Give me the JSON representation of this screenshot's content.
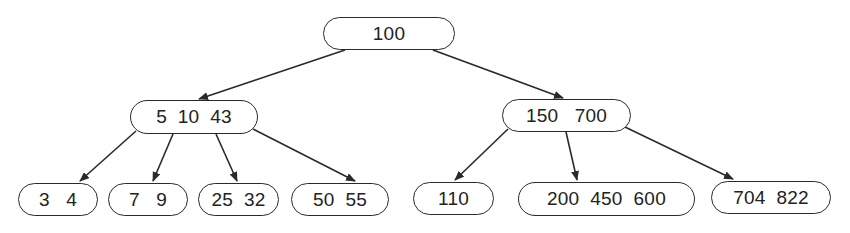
{
  "diagram": {
    "type": "b-tree",
    "colors": {
      "stroke": "#2a2a2a",
      "text": "#222222",
      "background": "#ffffff"
    },
    "nodes": {
      "root": {
        "label": "100",
        "keys": [
          100
        ],
        "x": 323,
        "y": 17,
        "w": 132,
        "h": 33
      },
      "internal_left": {
        "label": "5  10  43",
        "keys": [
          5,
          10,
          43
        ],
        "x": 130,
        "y": 100,
        "w": 128,
        "h": 34
      },
      "internal_right": {
        "label": "150   700",
        "keys": [
          150,
          700
        ],
        "x": 502,
        "y": 99,
        "w": 129,
        "h": 33
      },
      "leaf_1": {
        "label": "3   4",
        "keys": [
          3,
          4
        ],
        "x": 18,
        "y": 183,
        "w": 80,
        "h": 33
      },
      "leaf_2": {
        "label": "7   9",
        "keys": [
          7,
          9
        ],
        "x": 108,
        "y": 183,
        "w": 80,
        "h": 33
      },
      "leaf_3": {
        "label": "25  32",
        "keys": [
          25,
          32
        ],
        "x": 198,
        "y": 183,
        "w": 81,
        "h": 33
      },
      "leaf_4": {
        "label": "50  55",
        "keys": [
          50,
          55
        ],
        "x": 291,
        "y": 183,
        "w": 98,
        "h": 33
      },
      "leaf_5": {
        "label": "110",
        "keys": [
          110
        ],
        "x": 413,
        "y": 182,
        "w": 81,
        "h": 33
      },
      "leaf_6": {
        "label": "200  450  600",
        "keys": [
          200,
          450,
          600
        ],
        "x": 518,
        "y": 182,
        "w": 177,
        "h": 34
      },
      "leaf_7": {
        "label": "704  822",
        "keys": [
          704,
          822
        ],
        "x": 711,
        "y": 181,
        "w": 120,
        "h": 33
      }
    },
    "edges": [
      {
        "from": "root",
        "to": "internal_left",
        "x1": 345,
        "y1": 50,
        "x2": 199,
        "y2": 99
      },
      {
        "from": "root",
        "to": "internal_right",
        "x1": 433,
        "y1": 50,
        "x2": 563,
        "y2": 98
      },
      {
        "from": "internal_left",
        "to": "leaf_1",
        "x1": 136,
        "y1": 131,
        "x2": 80,
        "y2": 181
      },
      {
        "from": "internal_left",
        "to": "leaf_2",
        "x1": 173,
        "y1": 134,
        "x2": 153,
        "y2": 181
      },
      {
        "from": "internal_left",
        "to": "leaf_3",
        "x1": 216,
        "y1": 134,
        "x2": 237,
        "y2": 181
      },
      {
        "from": "internal_left",
        "to": "leaf_4",
        "x1": 253,
        "y1": 129,
        "x2": 355,
        "y2": 181
      },
      {
        "from": "internal_right",
        "to": "leaf_5",
        "x1": 508,
        "y1": 129,
        "x2": 455,
        "y2": 180
      },
      {
        "from": "internal_right",
        "to": "leaf_6",
        "x1": 566,
        "y1": 132,
        "x2": 577,
        "y2": 180
      },
      {
        "from": "internal_right",
        "to": "leaf_7",
        "x1": 625,
        "y1": 127,
        "x2": 733,
        "y2": 179
      }
    ]
  }
}
